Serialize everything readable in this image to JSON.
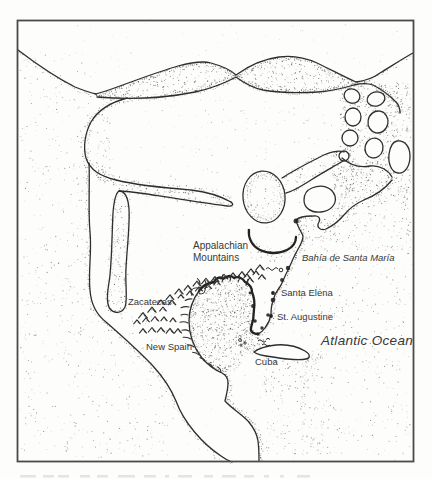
{
  "map": {
    "description": "Hand-drawn historical map of sixteenth-century North America with stippled coastlines",
    "labels": {
      "appalachian_line1": "Appalachian",
      "appalachian_line2": "Mountains",
      "bahia": "Bahía de Santa María",
      "zacatecas": "Zacatecas",
      "santa_elena": "Santa Elena",
      "st_augustine": "St. Augustine",
      "new_spain": "New Spain",
      "cuba": "Cuba",
      "atlantic_ocean": "Atlantic Ocean"
    },
    "markers": {
      "santa_elena": "settlement dot",
      "st_augustine": "settlement dot"
    },
    "colors": {
      "ink": "#2e2e2e",
      "paper": "#fdfdfc",
      "frame": "#4a4a4a",
      "label_text": "#383838"
    }
  }
}
